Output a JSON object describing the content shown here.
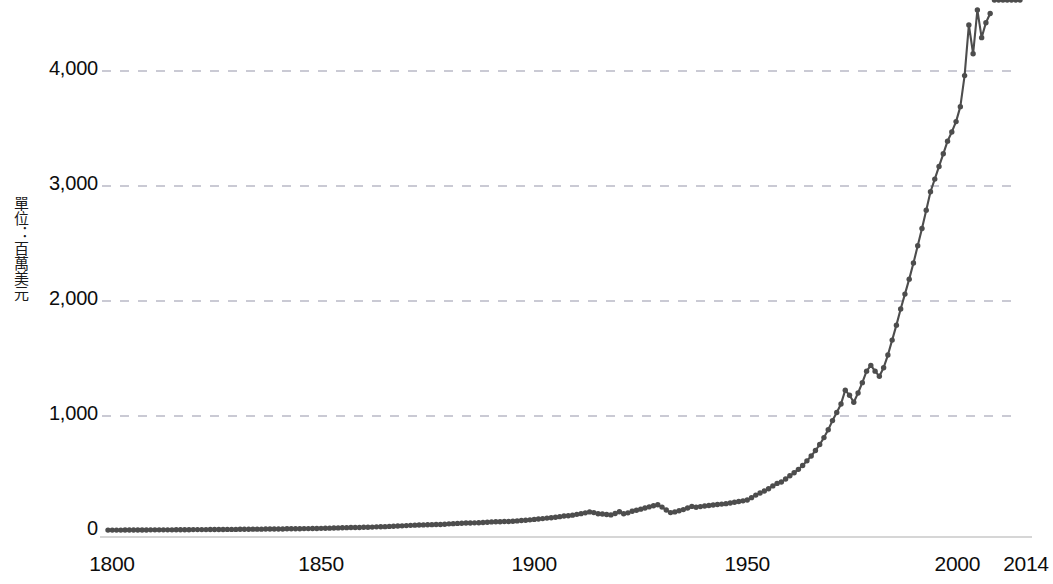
{
  "chart_data": {
    "type": "line",
    "title": "",
    "subtitle": "",
    "xlabel": "",
    "ylabel": "單位：百萬美元",
    "ylabel_parts": [
      "單",
      "位",
      "：",
      "百",
      "萬",
      "美",
      "元"
    ],
    "xlim": [
      1800,
      2014
    ],
    "ylim": [
      0,
      4400
    ],
    "y_axis_visible_max": 4000,
    "grid": true,
    "grid_axis": "y",
    "legend": null,
    "legend_position": "none",
    "line_color": "#4d4d4d",
    "marker_color": "#4d4d4d",
    "marker_shape": "circle",
    "axis_line_color": "#c8c8c8",
    "gridline_color": "#b9b9c6",
    "gridline_style": "dashed",
    "background_color": "#ffffff",
    "note": "Line rises above the top of the visible frame after ~2006 and is clipped by the image edge.",
    "yticks": [
      0,
      1000,
      2000,
      3000,
      4000
    ],
    "ytick_labels": [
      "0",
      "1,000",
      "2,000",
      "3,000",
      "4,000"
    ],
    "xticks": [
      1800,
      1850,
      1900,
      1950,
      2000,
      2014
    ],
    "xtick_labels": [
      "1800",
      "1850",
      "1900",
      "1950",
      "2000",
      "2014"
    ],
    "x": [
      1800,
      1801,
      1802,
      1803,
      1804,
      1805,
      1806,
      1807,
      1808,
      1809,
      1810,
      1811,
      1812,
      1813,
      1814,
      1815,
      1816,
      1817,
      1818,
      1819,
      1820,
      1821,
      1822,
      1823,
      1824,
      1825,
      1826,
      1827,
      1828,
      1829,
      1830,
      1831,
      1832,
      1833,
      1834,
      1835,
      1836,
      1837,
      1838,
      1839,
      1840,
      1841,
      1842,
      1843,
      1844,
      1845,
      1846,
      1847,
      1848,
      1849,
      1850,
      1851,
      1852,
      1853,
      1854,
      1855,
      1856,
      1857,
      1858,
      1859,
      1860,
      1861,
      1862,
      1863,
      1864,
      1865,
      1866,
      1867,
      1868,
      1869,
      1870,
      1871,
      1872,
      1873,
      1874,
      1875,
      1876,
      1877,
      1878,
      1879,
      1880,
      1881,
      1882,
      1883,
      1884,
      1885,
      1886,
      1887,
      1888,
      1889,
      1890,
      1891,
      1892,
      1893,
      1894,
      1895,
      1896,
      1897,
      1898,
      1899,
      1900,
      1901,
      1902,
      1903,
      1904,
      1905,
      1906,
      1907,
      1908,
      1909,
      1910,
      1911,
      1912,
      1913,
      1914,
      1915,
      1916,
      1917,
      1918,
      1919,
      1920,
      1921,
      1922,
      1923,
      1924,
      1925,
      1926,
      1927,
      1928,
      1929,
      1930,
      1931,
      1932,
      1933,
      1934,
      1935,
      1936,
      1937,
      1938,
      1939,
      1940,
      1941,
      1942,
      1943,
      1944,
      1945,
      1946,
      1947,
      1948,
      1949,
      1950,
      1951,
      1952,
      1953,
      1954,
      1955,
      1956,
      1957,
      1958,
      1959,
      1960,
      1961,
      1962,
      1963,
      1964,
      1965,
      1966,
      1967,
      1968,
      1969,
      1970,
      1971,
      1972,
      1973,
      1974,
      1975,
      1976,
      1977,
      1978,
      1979,
      1980,
      1981,
      1982,
      1983,
      1984,
      1985,
      1986,
      1987,
      1988,
      1989,
      1990,
      1991,
      1992,
      1993,
      1994,
      1995,
      1996,
      1997,
      1998,
      1999,
      2000,
      2001,
      2002,
      2003,
      2004,
      2005,
      2006,
      2007,
      2008,
      2009,
      2010,
      2011,
      2012,
      2013,
      2014
    ],
    "y": [
      8,
      8,
      8,
      8,
      9,
      9,
      9,
      9,
      9,
      9,
      10,
      10,
      10,
      10,
      10,
      10,
      11,
      11,
      11,
      11,
      12,
      12,
      12,
      12,
      13,
      13,
      13,
      13,
      14,
      14,
      14,
      15,
      15,
      15,
      16,
      16,
      16,
      17,
      17,
      17,
      18,
      18,
      19,
      19,
      20,
      20,
      21,
      21,
      22,
      22,
      23,
      24,
      25,
      26,
      27,
      28,
      29,
      30,
      30,
      31,
      33,
      33,
      34,
      36,
      37,
      38,
      40,
      41,
      43,
      45,
      47,
      49,
      51,
      52,
      53,
      54,
      55,
      56,
      57,
      59,
      62,
      64,
      66,
      68,
      69,
      70,
      71,
      72,
      74,
      76,
      79,
      80,
      81,
      82,
      83,
      85,
      88,
      91,
      94,
      97,
      101,
      104,
      108,
      112,
      115,
      119,
      125,
      130,
      132,
      138,
      145,
      151,
      158,
      166,
      160,
      150,
      148,
      143,
      140,
      152,
      168,
      150,
      158,
      172,
      180,
      190,
      200,
      210,
      220,
      228,
      208,
      182,
      160,
      166,
      176,
      186,
      200,
      214,
      206,
      212,
      218,
      222,
      226,
      230,
      234,
      238,
      244,
      250,
      256,
      262,
      270,
      290,
      312,
      330,
      348,
      368,
      392,
      414,
      426,
      452,
      480,
      506,
      536,
      570,
      610,
      652,
      700,
      752,
      812,
      880,
      960,
      1030,
      1105,
      1225,
      1180,
      1120,
      1200,
      1290,
      1390,
      1440,
      1390,
      1345,
      1420,
      1530,
      1660,
      1790,
      1930,
      2060,
      2190,
      2330,
      2480,
      2630,
      2790,
      2950,
      3060,
      3170,
      3280,
      3390,
      3470,
      3560,
      3690,
      3960,
      4400,
      4150,
      4530,
      4290,
      4420,
      4500
    ]
  },
  "axis": {
    "y_title": "單位：百萬美元"
  }
}
